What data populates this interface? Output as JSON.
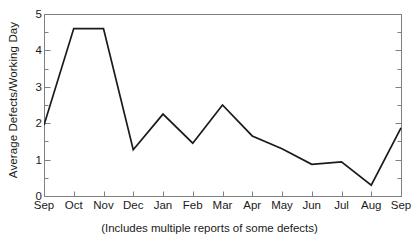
{
  "chart_data": {
    "type": "line",
    "title": "",
    "xlabel": "",
    "ylabel": "Average Defects/Working Day",
    "caption": "(Includes multiple reports of some defects)",
    "categories": [
      "Sep",
      "Oct",
      "Nov",
      "Dec",
      "Jan",
      "Feb",
      "Mar",
      "Apr",
      "May",
      "Jun",
      "Jul",
      "Aug",
      "Sep"
    ],
    "values": [
      1.95,
      4.6,
      4.6,
      1.27,
      2.25,
      1.45,
      2.5,
      1.65,
      1.3,
      0.87,
      0.94,
      0.3,
      1.87
    ],
    "ylim": [
      0,
      5
    ],
    "ytick_labels": [
      "0",
      "1",
      "2",
      "3",
      "4",
      "5"
    ],
    "ytick_values": [
      0,
      1,
      2,
      3,
      4,
      5
    ],
    "yminor_step": 0.5,
    "grid": false,
    "legend": null,
    "line_color": "#1a1a1a",
    "axis_color": "#808080",
    "series": [
      {
        "name": "Average Defects/Working Day",
        "values": [
          1.95,
          4.6,
          4.6,
          1.27,
          2.25,
          1.45,
          2.5,
          1.65,
          1.3,
          0.87,
          0.94,
          0.3,
          1.87
        ]
      }
    ]
  }
}
